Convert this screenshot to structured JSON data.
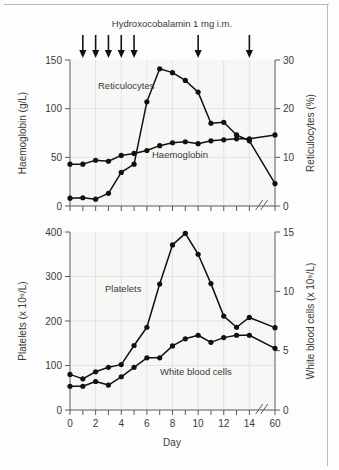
{
  "figure": {
    "title": "Hydroxocobalamin 1 mg i.m.",
    "background_color": "#f7f7f5",
    "line_color": "#111111"
  },
  "annotation": {
    "dose_arrow_days": [
      1,
      2,
      3,
      4,
      5,
      10,
      14
    ],
    "arrow_count": 7,
    "arrow_icon": "down-arrow-icon"
  },
  "chart_data": [
    {
      "type": "line",
      "id": "top-panel",
      "title": "Hydroxocobalamin 1 mg i.m.",
      "xlabel": "",
      "ylabel": "Haemoglobin (g/L)",
      "y2label": "Reticulocytes (%)",
      "xlim": [
        0,
        16
      ],
      "ylim": [
        0,
        150
      ],
      "y2lim": [
        0,
        30
      ],
      "xticks": [
        0,
        1,
        2,
        3,
        4,
        5,
        6,
        7,
        8,
        9,
        10,
        11,
        12,
        13,
        14,
        16
      ],
      "xticklabels": [
        "",
        "",
        "",
        "",
        "",
        "",
        "",
        "",
        "",
        "",
        "",
        "",
        "",
        "",
        "",
        ""
      ],
      "yticks": [
        0,
        50,
        100,
        150
      ],
      "yticklabels": [
        "0",
        "50",
        "100",
        "150"
      ],
      "y2ticks": [
        0,
        10,
        20,
        30
      ],
      "y2ticklabels": [
        "0",
        "10",
        "20",
        "30"
      ],
      "grid": true,
      "axis_break": {
        "after_x": 14,
        "before_x": 16,
        "label": "//"
      },
      "series": [
        {
          "name": "Haemoglobin",
          "axis": "left",
          "units": "g/L",
          "x": [
            0,
            1,
            2,
            3,
            4,
            5,
            6,
            7,
            8,
            9,
            10,
            11,
            12,
            13,
            14,
            16
          ],
          "values": [
            43,
            43,
            47,
            46,
            52,
            54,
            57,
            62,
            65,
            66,
            64,
            67,
            68,
            69,
            69,
            73
          ]
        },
        {
          "name": "Reticulocytes",
          "axis": "right",
          "units": "%",
          "x": [
            0,
            1,
            2,
            3,
            4,
            5,
            6,
            7,
            8,
            9,
            10,
            11,
            12,
            13,
            14,
            16
          ],
          "values": [
            1.6,
            1.7,
            1.4,
            2.6,
            6.9,
            8.6,
            21.4,
            28.2,
            27.4,
            25.8,
            23.4,
            17.0,
            17.2,
            14.6,
            13.4,
            4.6
          ]
        }
      ]
    },
    {
      "type": "line",
      "id": "bottom-panel",
      "title": "",
      "xlabel": "Day",
      "ylabel": "Platelets (x 10⁹/L)",
      "y2label": "White blood cells (x 10⁹/L)",
      "xlim": [
        0,
        16
      ],
      "ylim": [
        0,
        400
      ],
      "y2lim": [
        0,
        15
      ],
      "xticks": [
        0,
        1,
        2,
        3,
        4,
        5,
        6,
        7,
        8,
        9,
        10,
        11,
        12,
        13,
        14,
        16
      ],
      "xticklabels": [
        "0",
        "",
        "2",
        "",
        "4",
        "",
        "6",
        "",
        "8",
        "",
        "10",
        "",
        "12",
        "",
        "14",
        "60"
      ],
      "yticks": [
        0,
        100,
        200,
        300,
        400
      ],
      "yticklabels": [
        "0",
        "100",
        "200",
        "300",
        "400"
      ],
      "y2ticks": [
        0,
        5,
        10,
        15
      ],
      "y2ticklabels": [
        "0",
        "5",
        "10",
        "15"
      ],
      "grid": true,
      "axis_break": {
        "after_x": 14,
        "before_x": 16,
        "label": "//"
      },
      "series": [
        {
          "name": "Platelets",
          "axis": "left",
          "units": "x 10^9/L",
          "x": [
            0,
            1,
            2,
            3,
            4,
            5,
            6,
            7,
            8,
            9,
            10,
            11,
            12,
            13,
            14,
            16
          ],
          "values": [
            80,
            70,
            86,
            96,
            102,
            145,
            186,
            283,
            371,
            397,
            350,
            284,
            211,
            186,
            208,
            185
          ]
        },
        {
          "name": "White blood cells",
          "axis": "right",
          "units": "x 10^9/L",
          "x": [
            0,
            1,
            2,
            3,
            4,
            5,
            6,
            7,
            8,
            9,
            10,
            11,
            12,
            13,
            14,
            16
          ],
          "values": [
            2.0,
            2.0,
            2.4,
            2.1,
            2.8,
            3.6,
            4.4,
            4.4,
            5.4,
            6.0,
            6.3,
            5.7,
            6.1,
            6.3,
            6.3,
            5.2
          ]
        }
      ]
    }
  ],
  "labels": {
    "top_left_axis": "Haemoglobin (g/L)",
    "top_right_axis": "Reticulocytes (%)",
    "bottom_left_axis": "Platelets (x 10⁹/L)",
    "bottom_right_axis": "White blood cells (x 10⁹/L)",
    "x_axis": "Day",
    "series_reticulocytes": "Reticulocytes",
    "series_haemoglobin": "Haemoglobin",
    "series_platelets": "Platelets",
    "series_wbc": "White blood cells",
    "break_mark": "//"
  },
  "ticks": {
    "top_left": [
      "150",
      "100",
      "50",
      "0"
    ],
    "top_right": [
      "30",
      "20",
      "10",
      "0"
    ],
    "bottom_left": [
      "400",
      "300",
      "200",
      "100",
      "0"
    ],
    "bottom_right": [
      "15",
      "10",
      "5",
      "0"
    ],
    "x": [
      "0",
      "2",
      "4",
      "6",
      "8",
      "10",
      "12",
      "14",
      "60"
    ]
  }
}
